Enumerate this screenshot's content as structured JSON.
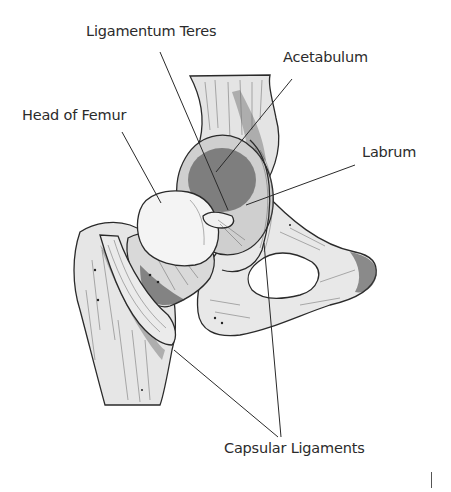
{
  "figure": {
    "background_color": "#ffffff",
    "text_color": "#2b2b2b",
    "line_color": "#2a2a2a"
  },
  "labels": [
    {
      "id": "ligamentum-teres",
      "text": "Ligamentum Teres",
      "x": 86,
      "y": 31,
      "leader": [
        [
          160,
          52
        ],
        [
          228,
          210
        ]
      ]
    },
    {
      "id": "acetabulum",
      "text": "Acetabulum",
      "x": 283,
      "y": 57,
      "leader": [
        [
          292,
          79
        ],
        [
          216,
          172
        ]
      ]
    },
    {
      "id": "head-of-femur",
      "text": "Head of Femur",
      "x": 22,
      "y": 115,
      "leader": [
        [
          122,
          132
        ],
        [
          161,
          203
        ]
      ]
    },
    {
      "id": "labrum",
      "text": "Labrum",
      "x": 362,
      "y": 152,
      "leader": [
        [
          355,
          165
        ],
        [
          246,
          205
        ]
      ]
    },
    {
      "id": "capsular-ligaments",
      "text": "Capsular Ligaments",
      "x": 224,
      "y": 448,
      "leader_a": [
        [
          174,
          350
        ],
        [
          278,
          437
        ]
      ],
      "leader_b": [
        [
          264,
          243
        ],
        [
          281,
          437
        ]
      ]
    }
  ]
}
